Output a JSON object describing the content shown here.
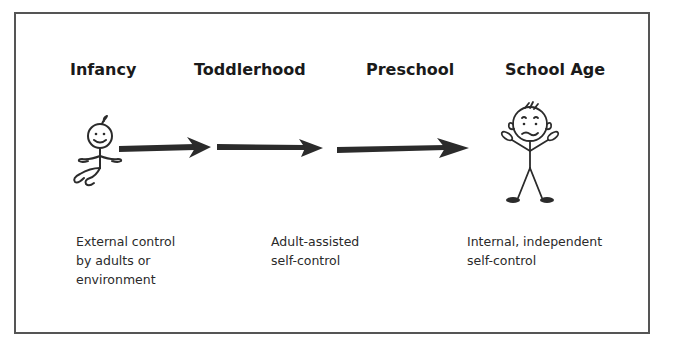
{
  "diagram": {
    "stages": [
      {
        "label": "Infancy"
      },
      {
        "label": "Toddlerhood"
      },
      {
        "label": "Preschool"
      },
      {
        "label": "School Age"
      }
    ],
    "descriptions": [
      {
        "lines": [
          "External control",
          "by adults or",
          "environment"
        ]
      },
      {
        "lines": [
          "Adult-assisted",
          "self-control"
        ]
      },
      {
        "lines": [
          "Internal, independent",
          "self-control"
        ]
      }
    ],
    "figures": {
      "start": "baby-stick-figure",
      "end": "child-stick-figure"
    },
    "arrows": 3,
    "colors": {
      "border": "#555555",
      "ink": "#2b2b2b",
      "text": "#1e1e1e"
    }
  }
}
